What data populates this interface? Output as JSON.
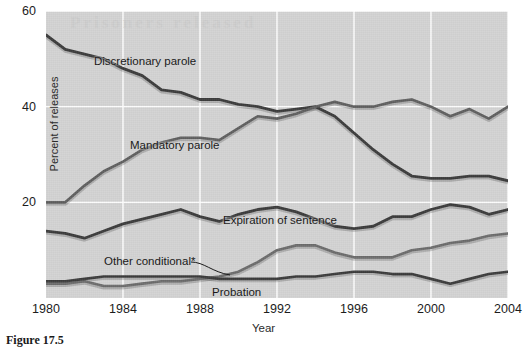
{
  "figure": {
    "caption": "Figure 17.5",
    "bleed_through_text": "Prisoners released"
  },
  "axes": {
    "ylabel": "Percent of releases",
    "xlabel": "Year",
    "yticks": [
      20,
      40,
      60
    ],
    "ylim": [
      0,
      60
    ],
    "xticks": [
      1980,
      1984,
      1988,
      1992,
      1996,
      2000,
      2004
    ],
    "xlim": [
      1980,
      2004
    ],
    "grid": true,
    "plot_background": "#d2d2d2",
    "grid_color": "#ffffff"
  },
  "series_labels": {
    "discretionary": "Discretionary parole",
    "mandatory": "Mandatory parole",
    "expiration": "Expiration of sentence",
    "other": "Other conditional*",
    "probation": "Probation"
  },
  "chart_data": {
    "type": "line",
    "title": "",
    "xlabel": "Year",
    "ylabel": "Percent of releases",
    "xlim": [
      1980,
      2004
    ],
    "ylim": [
      0,
      60
    ],
    "grid": true,
    "legend": "inline-labels",
    "x": [
      1980,
      1981,
      1982,
      1983,
      1984,
      1985,
      1986,
      1987,
      1988,
      1989,
      1990,
      1991,
      1992,
      1993,
      1994,
      1995,
      1996,
      1997,
      1998,
      1999,
      2000,
      2001,
      2002,
      2003,
      2004
    ],
    "series": [
      {
        "name": "Discretionary parole",
        "color": "#3a3a3a",
        "width": 2.8,
        "values": [
          55.0,
          52.0,
          51.0,
          50.0,
          48.0,
          46.5,
          43.5,
          43.0,
          41.5,
          41.5,
          40.5,
          40.0,
          39.0,
          39.5,
          40.0,
          38.0,
          34.5,
          31.0,
          28.0,
          25.5,
          25.0,
          25.0,
          25.5,
          25.5,
          24.5
        ]
      },
      {
        "name": "Mandatory parole",
        "color": "#5e5e5e",
        "width": 2.6,
        "values": [
          20.0,
          20.0,
          23.5,
          26.5,
          28.5,
          31.0,
          32.5,
          33.5,
          33.5,
          33.0,
          35.5,
          38.0,
          37.5,
          38.5,
          40.0,
          41.0,
          40.0,
          40.0,
          41.0,
          41.5,
          40.0,
          38.0,
          39.5,
          37.5,
          40.0
        ]
      },
      {
        "name": "Expiration of sentence",
        "color": "#3a3a3a",
        "width": 2.8,
        "values": [
          14.0,
          13.5,
          12.5,
          14.0,
          15.5,
          16.5,
          17.5,
          18.5,
          17.0,
          16.0,
          17.5,
          18.5,
          19.0,
          18.0,
          16.5,
          15.0,
          14.5,
          15.0,
          17.0,
          17.0,
          18.5,
          19.5,
          19.0,
          17.5,
          18.5
        ]
      },
      {
        "name": "Other conditional",
        "color": "#6b6b6b",
        "width": 2.6,
        "values": [
          3.0,
          3.0,
          3.5,
          2.5,
          2.5,
          3.0,
          3.5,
          3.5,
          4.0,
          4.5,
          5.5,
          7.5,
          10.0,
          11.0,
          11.0,
          9.5,
          8.5,
          8.5,
          8.5,
          10.0,
          10.5,
          11.5,
          12.0,
          13.0,
          13.5
        ]
      },
      {
        "name": "Probation",
        "color": "#3a3a3a",
        "width": 2.6,
        "values": [
          3.5,
          3.5,
          4.0,
          4.5,
          4.5,
          4.5,
          4.5,
          4.5,
          4.5,
          4.0,
          4.0,
          4.0,
          4.0,
          4.5,
          4.5,
          5.0,
          5.5,
          5.5,
          5.0,
          5.0,
          4.0,
          3.0,
          4.0,
          5.0,
          5.5
        ]
      }
    ],
    "footnote_marker": "*"
  }
}
